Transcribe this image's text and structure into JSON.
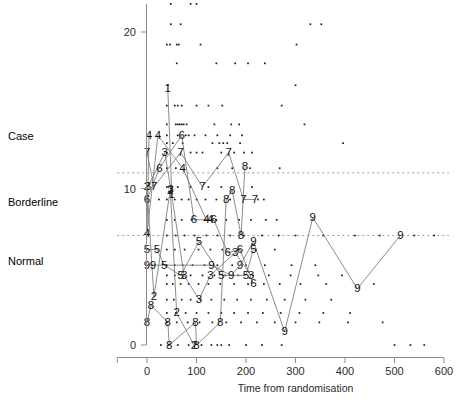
{
  "chart_data": {
    "type": "scatter",
    "title": "",
    "subtitle": "",
    "xlabel": "Time from randomisation",
    "ylabel": "",
    "xlim": [
      -60,
      610
    ],
    "ylim": [
      -1.2,
      22.5
    ],
    "grid": false,
    "legend": "none",
    "x_ticks": [
      0,
      100,
      200,
      300,
      400,
      500,
      600
    ],
    "x_tick_labels": [
      "0",
      "100",
      "200",
      "300",
      "400",
      "500",
      "600"
    ],
    "x_axis_extent": [
      -60,
      600
    ],
    "y_ticks": [
      0,
      10,
      20
    ],
    "y_tick_labels": [
      "0",
      "10",
      "20"
    ],
    "y_axis_extent": [
      0,
      21.8
    ],
    "category_labels": [
      {
        "text": "Case",
        "value": 13.3
      },
      {
        "text": "Borderline",
        "value": 9.1
      },
      {
        "text": "Normal",
        "value": 5.3
      }
    ],
    "threshold_lines": [
      {
        "value": 11,
        "style": "dashed",
        "label": "case-threshold"
      },
      {
        "value": 7,
        "style": "dashed",
        "label": "borderline-threshold"
      }
    ],
    "series": [
      {
        "name": "1",
        "marker": "1",
        "points": [
          [
            42,
            16.4
          ],
          [
            50,
            9.6
          ]
        ]
      },
      {
        "name": "2",
        "marker": "2",
        "points": [
          [
            0,
            10.1
          ],
          [
            14,
            3.1
          ],
          [
            47,
            9.9
          ],
          [
            60,
            2.05
          ],
          [
            95,
            0.0
          ]
        ]
      },
      {
        "name": "3",
        "marker": "3",
        "points": [
          [
            2,
            10.1
          ],
          [
            36,
            12.3
          ],
          [
            48,
            9.95
          ],
          [
            75,
            4.45
          ],
          [
            105,
            2.9
          ],
          [
            128,
            4.45
          ],
          [
            178,
            5.9
          ],
          [
            210,
            4.45
          ]
        ]
      },
      {
        "name": "4",
        "marker": "4",
        "points": [
          [
            4,
            13.4
          ],
          [
            0,
            7.1
          ],
          [
            22,
            13.4
          ],
          [
            72,
            11.3
          ],
          [
            120,
            8.0
          ],
          [
            128,
            8.0
          ]
        ]
      },
      {
        "name": "5",
        "marker": "5",
        "points": [
          [
            0,
            6.1
          ],
          [
            20,
            6.1
          ],
          [
            35,
            5.1
          ],
          [
            68,
            4.45
          ],
          [
            105,
            6.6
          ],
          [
            150,
            4.45
          ],
          [
            200,
            4.45
          ],
          [
            215,
            6.1
          ]
        ]
      },
      {
        "name": "6",
        "marker": "6",
        "points": [
          [
            0,
            9.3
          ],
          [
            25,
            11.3
          ],
          [
            70,
            13.4
          ],
          [
            95,
            8.0
          ],
          [
            135,
            8.0
          ],
          [
            163,
            5.9
          ],
          [
            188,
            6.1
          ],
          [
            215,
            3.9
          ]
        ]
      },
      {
        "name": "7",
        "marker": "7",
        "points": [
          [
            0,
            12.3
          ],
          [
            14,
            10.1
          ],
          [
            68,
            12.3
          ],
          [
            112,
            10.1
          ],
          [
            165,
            12.3
          ],
          [
            195,
            9.3
          ],
          [
            218,
            9.3
          ]
        ]
      },
      {
        "name": "8",
        "marker": "8",
        "points": [
          [
            0,
            1.45
          ],
          [
            8,
            2.55
          ],
          [
            42,
            1.45
          ],
          [
            45,
            0.0
          ],
          [
            98,
            1.45
          ],
          [
            100,
            0.0
          ],
          [
            148,
            1.45
          ],
          [
            160,
            9.3
          ],
          [
            172,
            9.9
          ],
          [
            190,
            7.0
          ],
          [
            198,
            11.4
          ]
        ]
      },
      {
        "name": "9",
        "marker": "9",
        "points": [
          [
            0,
            5.1
          ],
          [
            12,
            5.1
          ],
          [
            130,
            5.1
          ],
          [
            170,
            4.45
          ],
          [
            188,
            5.1
          ],
          [
            215,
            6.6
          ],
          [
            278,
            0.85
          ],
          [
            335,
            8.15
          ],
          [
            425,
            3.6
          ],
          [
            512,
            7.0
          ]
        ]
      }
    ],
    "background_points": [
      [
        48,
        21.8
      ],
      [
        88,
        21.8
      ],
      [
        100,
        21.8
      ],
      [
        48,
        20.5
      ],
      [
        68,
        20.5
      ],
      [
        330,
        20.5
      ],
      [
        352,
        20.5
      ],
      [
        40,
        19.2
      ],
      [
        46,
        19.2
      ],
      [
        60,
        19.2
      ],
      [
        64,
        19.2
      ],
      [
        108,
        19.2
      ],
      [
        302,
        19.2
      ],
      [
        60,
        18.0
      ],
      [
        140,
        18.0
      ],
      [
        178,
        18.0
      ],
      [
        204,
        18.0
      ],
      [
        238,
        18.0
      ],
      [
        42,
        16.6
      ],
      [
        300,
        16.6
      ],
      [
        40,
        15.3
      ],
      [
        56,
        15.3
      ],
      [
        62,
        15.3
      ],
      [
        70,
        15.3
      ],
      [
        100,
        15.3
      ],
      [
        124,
        15.3
      ],
      [
        152,
        15.3
      ],
      [
        272,
        15.3
      ],
      [
        40,
        14.1
      ],
      [
        58,
        14.1
      ],
      [
        62,
        14.1
      ],
      [
        66,
        14.1
      ],
      [
        70,
        14.1
      ],
      [
        74,
        14.1
      ],
      [
        80,
        14.1
      ],
      [
        136,
        14.1
      ],
      [
        170,
        14.1
      ],
      [
        186,
        14.1
      ],
      [
        318,
        14.1
      ],
      [
        40,
        12.9
      ],
      [
        52,
        12.9
      ],
      [
        72,
        12.9
      ],
      [
        132,
        12.9
      ],
      [
        146,
        12.9
      ],
      [
        154,
        12.9
      ],
      [
        162,
        12.9
      ],
      [
        188,
        12.9
      ],
      [
        396,
        12.9
      ],
      [
        40,
        13.4
      ],
      [
        62,
        13.4
      ],
      [
        78,
        13.4
      ],
      [
        84,
        13.4
      ],
      [
        96,
        13.4
      ],
      [
        118,
        13.4
      ],
      [
        142,
        13.4
      ],
      [
        168,
        13.4
      ],
      [
        192,
        13.4
      ],
      [
        40,
        12.3
      ],
      [
        88,
        12.3
      ],
      [
        100,
        12.3
      ],
      [
        112,
        12.3
      ],
      [
        150,
        12.3
      ],
      [
        176,
        12.3
      ],
      [
        196,
        12.3
      ],
      [
        212,
        12.3
      ],
      [
        40,
        11.3
      ],
      [
        58,
        11.3
      ],
      [
        142,
        11.3
      ],
      [
        172,
        11.3
      ],
      [
        208,
        11.3
      ],
      [
        268,
        11.3
      ],
      [
        40,
        10.1
      ],
      [
        62,
        10.1
      ],
      [
        88,
        10.1
      ],
      [
        124,
        10.1
      ],
      [
        150,
        10.1
      ],
      [
        212,
        10.1
      ],
      [
        40,
        9.3
      ],
      [
        24,
        9.3
      ],
      [
        56,
        9.3
      ],
      [
        70,
        9.3
      ],
      [
        84,
        9.3
      ],
      [
        100,
        9.3
      ],
      [
        118,
        9.3
      ],
      [
        140,
        9.3
      ],
      [
        168,
        9.3
      ],
      [
        224,
        9.3
      ],
      [
        236,
        9.3
      ],
      [
        40,
        8.0
      ],
      [
        56,
        8.0
      ],
      [
        70,
        8.0
      ],
      [
        90,
        8.0
      ],
      [
        118,
        8.0
      ],
      [
        140,
        8.0
      ],
      [
        160,
        8.0
      ],
      [
        186,
        8.0
      ],
      [
        210,
        8.0
      ],
      [
        240,
        8.0
      ],
      [
        262,
        8.0
      ],
      [
        40,
        7.0
      ],
      [
        58,
        7.0
      ],
      [
        76,
        7.0
      ],
      [
        96,
        7.0
      ],
      [
        120,
        7.0
      ],
      [
        142,
        7.0
      ],
      [
        168,
        7.0
      ],
      [
        196,
        7.0
      ],
      [
        232,
        7.0
      ],
      [
        266,
        7.0
      ],
      [
        300,
        7.0
      ],
      [
        356,
        7.0
      ],
      [
        420,
        7.0
      ],
      [
        470,
        7.0
      ],
      [
        540,
        7.0
      ],
      [
        580,
        7.0
      ],
      [
        40,
        6.1
      ],
      [
        56,
        6.1
      ],
      [
        76,
        6.1
      ],
      [
        104,
        6.1
      ],
      [
        128,
        6.1
      ],
      [
        152,
        6.1
      ],
      [
        186,
        6.1
      ],
      [
        220,
        6.1
      ],
      [
        258,
        6.1
      ],
      [
        40,
        5.1
      ],
      [
        56,
        5.1
      ],
      [
        72,
        5.1
      ],
      [
        92,
        5.1
      ],
      [
        116,
        5.1
      ],
      [
        142,
        5.1
      ],
      [
        172,
        5.1
      ],
      [
        200,
        5.1
      ],
      [
        238,
        5.1
      ],
      [
        292,
        5.1
      ],
      [
        340,
        5.1
      ],
      [
        40,
        4.45
      ],
      [
        56,
        4.45
      ],
      [
        72,
        4.45
      ],
      [
        88,
        4.45
      ],
      [
        112,
        4.45
      ],
      [
        136,
        4.45
      ],
      [
        158,
        4.45
      ],
      [
        184,
        4.45
      ],
      [
        214,
        4.45
      ],
      [
        246,
        4.45
      ],
      [
        290,
        4.45
      ],
      [
        346,
        4.45
      ],
      [
        394,
        4.45
      ],
      [
        40,
        3.9
      ],
      [
        52,
        3.9
      ],
      [
        68,
        3.9
      ],
      [
        84,
        3.9
      ],
      [
        104,
        3.9
      ],
      [
        124,
        3.9
      ],
      [
        148,
        3.9
      ],
      [
        176,
        3.9
      ],
      [
        204,
        3.9
      ],
      [
        236,
        3.9
      ],
      [
        268,
        3.9
      ],
      [
        310,
        3.9
      ],
      [
        362,
        3.9
      ],
      [
        458,
        3.9
      ],
      [
        40,
        2.9
      ],
      [
        54,
        2.9
      ],
      [
        70,
        2.9
      ],
      [
        88,
        2.9
      ],
      [
        108,
        2.9
      ],
      [
        130,
        2.9
      ],
      [
        156,
        2.9
      ],
      [
        182,
        2.9
      ],
      [
        210,
        2.9
      ],
      [
        242,
        2.9
      ],
      [
        278,
        2.9
      ],
      [
        320,
        2.9
      ],
      [
        372,
        2.9
      ],
      [
        40,
        2.05
      ],
      [
        58,
        2.05
      ],
      [
        78,
        2.05
      ],
      [
        100,
        2.05
      ],
      [
        124,
        2.05
      ],
      [
        150,
        2.05
      ],
      [
        176,
        2.05
      ],
      [
        204,
        2.05
      ],
      [
        234,
        2.05
      ],
      [
        270,
        2.05
      ],
      [
        308,
        2.05
      ],
      [
        356,
        2.05
      ],
      [
        410,
        2.05
      ],
      [
        40,
        1.45
      ],
      [
        60,
        1.45
      ],
      [
        82,
        1.45
      ],
      [
        106,
        1.45
      ],
      [
        132,
        1.45
      ],
      [
        160,
        1.45
      ],
      [
        190,
        1.45
      ],
      [
        222,
        1.45
      ],
      [
        258,
        1.45
      ],
      [
        300,
        1.45
      ],
      [
        348,
        1.45
      ],
      [
        406,
        1.45
      ],
      [
        476,
        1.45
      ],
      [
        28,
        0.0
      ],
      [
        44,
        0.0
      ],
      [
        62,
        0.0
      ],
      [
        84,
        0.0
      ],
      [
        110,
        0.0
      ],
      [
        130,
        0.0
      ],
      [
        142,
        0.0
      ],
      [
        150,
        0.0
      ],
      [
        166,
        0.0
      ],
      [
        200,
        0.0
      ],
      [
        232,
        0.0
      ],
      [
        272,
        0.0
      ],
      [
        500,
        0.0
      ],
      [
        532,
        0.0
      ],
      [
        560,
        0.0
      ]
    ]
  }
}
